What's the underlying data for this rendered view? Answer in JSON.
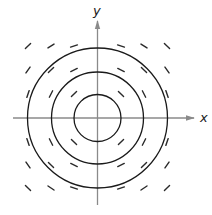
{
  "diagram": {
    "type": "vector-field",
    "axes": {
      "x_label": "x",
      "y_label": "y",
      "color": "#8a8a8a"
    },
    "origin": {
      "cx": 97.5,
      "cy": 118
    },
    "circles": {
      "color": "#1a1a1a",
      "radii": [
        23.5,
        46,
        70
      ]
    },
    "field": {
      "color": "#2a2a2a",
      "grid_x": [
        28,
        51,
        74,
        121,
        144,
        167
      ],
      "grid_y": [
        46,
        70,
        94,
        142,
        165,
        188
      ],
      "segment_half_length": 3.6
    }
  }
}
